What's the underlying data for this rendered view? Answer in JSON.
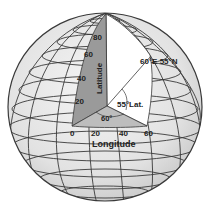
{
  "diagram": {
    "latitude_axis": {
      "label": "Latitude",
      "ticks": [
        "20",
        "40",
        "60",
        "80"
      ]
    },
    "longitude_axis": {
      "label": "Longitude",
      "ticks": [
        "0",
        "20",
        "40",
        "60"
      ]
    },
    "annotations": {
      "point_label": "60°E 55°N",
      "latitude_angle": "55°Lat.",
      "longitude_angle": "60°"
    },
    "colors": {
      "globe_fill": "#e8e8e8",
      "grid_line": "#3a3a3a",
      "latitude_plane": "#9a9a9a",
      "equator_plane": "#bdbdbd",
      "cutout": "#ffffff",
      "text": "#222222"
    }
  }
}
